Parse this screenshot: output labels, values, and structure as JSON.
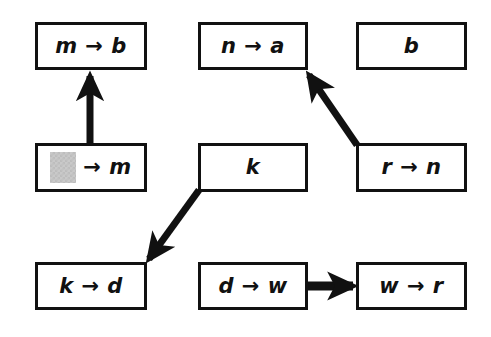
{
  "diagram": {
    "type": "flow-diagram",
    "background_color": "#ffffff",
    "stroke_color": "#111111",
    "blank_fill_color": "#c9c9c9",
    "nodes": [
      {
        "id": "m-to-b",
        "label": "m → b",
        "x": 35,
        "y": 22,
        "w": 112,
        "h": 48,
        "has_blank": false
      },
      {
        "id": "n-to-a",
        "label": "n → a",
        "x": 198,
        "y": 22,
        "w": 110,
        "h": 48,
        "has_blank": false
      },
      {
        "id": "b",
        "label": "b",
        "x": 356,
        "y": 22,
        "w": 111,
        "h": 48,
        "has_blank": false
      },
      {
        "id": "blank-to-m",
        "label": "→ m",
        "x": 35,
        "y": 143,
        "w": 112,
        "h": 49,
        "has_blank": true
      },
      {
        "id": "k",
        "label": "k",
        "x": 198,
        "y": 143,
        "w": 110,
        "h": 49,
        "has_blank": false
      },
      {
        "id": "r-to-n",
        "label": "r → n",
        "x": 356,
        "y": 143,
        "w": 111,
        "h": 49,
        "has_blank": false
      },
      {
        "id": "k-to-d",
        "label": "k → d",
        "x": 35,
        "y": 262,
        "w": 112,
        "h": 48,
        "has_blank": false
      },
      {
        "id": "d-to-w",
        "label": "d → w",
        "x": 198,
        "y": 262,
        "w": 110,
        "h": 48,
        "has_blank": false
      },
      {
        "id": "w-to-r",
        "label": "w → r",
        "x": 356,
        "y": 262,
        "w": 111,
        "h": 48,
        "has_blank": false
      }
    ],
    "edges": [
      {
        "id": "edge-blank-to-m-up",
        "from": "blank-to-m",
        "to": "m-to-b",
        "x1": 90,
        "y1": 143,
        "x2": 90,
        "y2": 74,
        "direction": "up"
      },
      {
        "id": "edge-r-to-n-up-left",
        "from": "r-to-n",
        "to": "n-to-a",
        "x1": 357,
        "y1": 145,
        "x2": 306,
        "y2": 72,
        "direction": "up-left"
      },
      {
        "id": "edge-k-down-left",
        "from": "k",
        "to": "k-to-d",
        "x1": 199,
        "y1": 190,
        "x2": 147,
        "y2": 261,
        "direction": "down-left"
      },
      {
        "id": "edge-d-to-w-right",
        "from": "d-to-w",
        "to": "w-to-r",
        "x1": 308,
        "y1": 286,
        "x2": 354,
        "y2": 286,
        "direction": "right"
      }
    ]
  }
}
